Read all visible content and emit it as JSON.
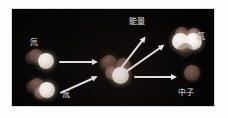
{
  "figure": {
    "background_color": "#040404",
    "frame_color": "#d8d8d8",
    "page_color": "#fdfdfd",
    "arrow_color": "#f2f2f2",
    "label_color": "#ececec"
  },
  "labels": {
    "deuterium": "氘",
    "tritium": "氚",
    "energy": "能量",
    "helium": "氦",
    "neutron": "中子"
  },
  "reactants": [
    {
      "name": "氘",
      "label": "氘",
      "nucleons": 2,
      "description": "deuterium nucleus: one proton and one neutron"
    },
    {
      "name": "氚",
      "label": "氚",
      "nucleons": 3,
      "description": "tritium nucleus: one proton and two neutrons"
    }
  ],
  "products": [
    {
      "name": "氦",
      "label": "氦",
      "nucleons": 4,
      "description": "helium-4 nucleus: two protons and two neutrons"
    },
    {
      "name": "中子",
      "label": "中子",
      "nucleons": 1,
      "description": "free neutron released"
    },
    {
      "name": "能量",
      "label": "能量",
      "description": "energy released by the fusion reaction"
    }
  ],
  "arrows": [
    {
      "name": "deuterium-inbound",
      "direction": "right"
    },
    {
      "name": "tritium-inbound",
      "direction": "up-right"
    },
    {
      "name": "energy-outbound",
      "direction": "up-right"
    },
    {
      "name": "helium-outbound",
      "direction": "up-right"
    },
    {
      "name": "neutron-outbound",
      "direction": "right"
    }
  ]
}
